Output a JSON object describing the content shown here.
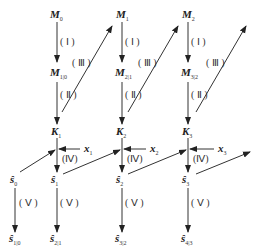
{
  "diagram": {
    "nodes": {
      "M0": {
        "base": "M",
        "sub": "0"
      },
      "M1": {
        "base": "M",
        "sub": "1"
      },
      "M2": {
        "base": "M",
        "sub": "2"
      },
      "M10": {
        "base": "M",
        "sub": "1|0"
      },
      "M21": {
        "base": "M",
        "sub": "2|1"
      },
      "M32": {
        "base": "M",
        "sub": "3|2"
      },
      "K1": {
        "base": "K",
        "sub": "1"
      },
      "K2": {
        "base": "K",
        "sub": "2"
      },
      "K3": {
        "base": "K",
        "sub": "3"
      },
      "x1": {
        "base": "x",
        "sub": "1"
      },
      "x2": {
        "base": "x",
        "sub": "2"
      },
      "x3": {
        "base": "x",
        "sub": "3"
      },
      "s0": {
        "base": "ŝ",
        "sub": "0"
      },
      "s1": {
        "base": "ŝ",
        "sub": "1"
      },
      "s2": {
        "base": "ŝ",
        "sub": "2"
      },
      "s3": {
        "base": "ŝ",
        "sub": "3"
      },
      "s10": {
        "base": "ŝ",
        "sub": "1|0"
      },
      "s21": {
        "base": "ŝ",
        "sub": "2|1"
      },
      "s32": {
        "base": "ŝ",
        "sub": "3|2"
      },
      "s43": {
        "base": "ŝ",
        "sub": "4|3"
      }
    },
    "steps": {
      "I": "( Ⅰ )",
      "II": "( Ⅱ )",
      "III": "( Ⅲ )",
      "IV": "(Ⅳ)",
      "V": "( Ⅴ )"
    }
  }
}
